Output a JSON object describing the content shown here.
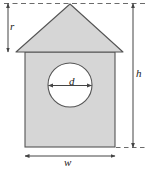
{
  "figure": {
    "kind": "geometry-diagram",
    "colors": {
      "fill": "#d6d6d6",
      "stroke": "#555555",
      "circle_fill": "#ffffff",
      "dimension_line": "#444444",
      "dashed_line": "#6b6b6b",
      "label_text": "#1a1a1a",
      "background": "#ffffff"
    },
    "labels": {
      "roof_height": "r",
      "total_height": "h",
      "width": "w",
      "diameter": "d"
    },
    "geometry": {
      "apex": [
        70,
        4
      ],
      "eave_left": [
        16,
        52
      ],
      "eave_right": [
        123,
        52
      ],
      "body_left": 25,
      "body_right": 115,
      "body_top": 52,
      "body_bottom": 147,
      "circle_center": [
        70,
        85
      ],
      "circle_radius": 22
    },
    "dimensions": {
      "r": {
        "axis": "vertical",
        "x": 8,
        "from_y": 3,
        "to_y": 52
      },
      "h": {
        "axis": "vertical",
        "x": 133,
        "from_y": 3,
        "to_y": 147
      },
      "w": {
        "axis": "horizontal",
        "y": 156,
        "from_x": 25,
        "to_x": 115
      },
      "d": {
        "axis": "horizontal",
        "y": 85,
        "from_x": 48,
        "to_x": 92
      }
    }
  }
}
